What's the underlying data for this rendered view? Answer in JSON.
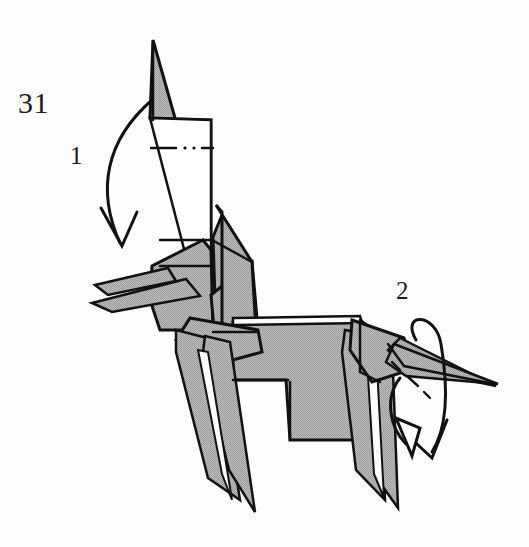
{
  "diagram": {
    "step_number": "31",
    "background_color": "#fdfdfd",
    "paper_shaded_color": "#b2b2b2",
    "paper_white_color": "#ffffff",
    "line_color": "#111111",
    "labels": [
      {
        "id": "step",
        "text": "31",
        "name": "step-number-label"
      },
      {
        "id": "fold1",
        "text": "1",
        "name": "fold-label-1"
      },
      {
        "id": "fold2",
        "text": "2",
        "name": "fold-label-2"
      }
    ],
    "annotations": {
      "arrow_1": {
        "label": "1",
        "description": "long curved valley-fold arrow sweeping down over the neck to the head",
        "arrowhead": "open-v",
        "target": "head"
      },
      "arrow_2_outer": {
        "label": "2",
        "description": "loop-around arrow encircling the tail, hollow triangular arrowhead",
        "arrowhead": "hollow-triangle",
        "target": "tail"
      },
      "arrow_2_inner": {
        "label": "2",
        "description": "second loop arrow around the tail, open-v arrowhead",
        "arrowhead": "open-v",
        "target": "tail"
      },
      "fold_line_neck": {
        "style": "dash-dot-dot",
        "description": "mountain/valley crease marked across the upper neck"
      },
      "fold_line_tail": {
        "style": "dash-dot",
        "description": "crease marked across the tail"
      }
    },
    "parts": [
      "neck",
      "head",
      "ear-upper",
      "ear-lower",
      "body",
      "front-legs",
      "hind-legs",
      "tail"
    ]
  }
}
